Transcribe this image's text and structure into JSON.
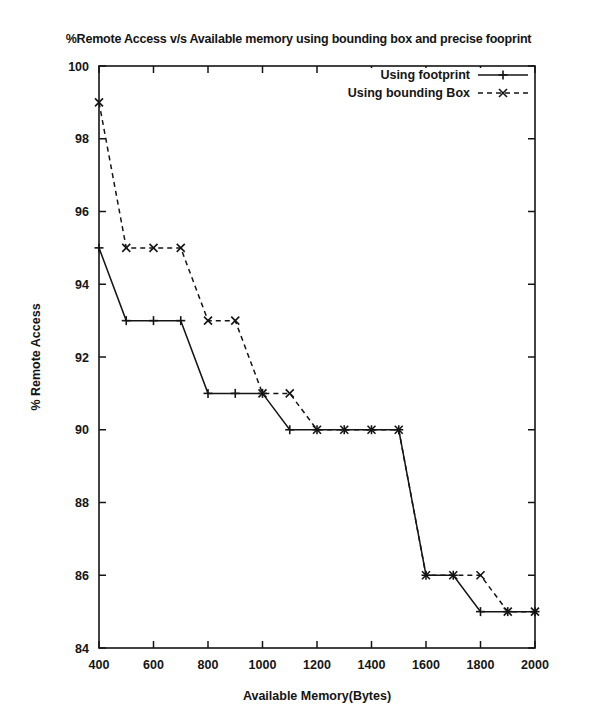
{
  "chart_data": {
    "type": "line",
    "title": "%Remote Access v/s Available memory using bounding box and precise fooprint",
    "xlabel": "Available Memory(Bytes)",
    "ylabel": "% Remote Access",
    "x": [
      400,
      500,
      600,
      700,
      800,
      900,
      1000,
      1100,
      1200,
      1300,
      1400,
      1500,
      1600,
      1700,
      1800,
      1900,
      2000
    ],
    "xlim": [
      400,
      2000
    ],
    "ylim": [
      84,
      100
    ],
    "xticks": [
      "400",
      "600",
      "800",
      "1000",
      "1200",
      "1400",
      "1600",
      "1800",
      "2000"
    ],
    "xtick_values": [
      400,
      600,
      800,
      1000,
      1200,
      1400,
      1600,
      1800,
      2000
    ],
    "yticks": [
      "84",
      "86",
      "88",
      "90",
      "92",
      "94",
      "96",
      "98",
      "100"
    ],
    "ytick_values": [
      84,
      86,
      88,
      90,
      92,
      94,
      96,
      98,
      100
    ],
    "grid": false,
    "legend_position": "top-right",
    "series": [
      {
        "name": "Using footprint",
        "style": "solid",
        "marker": "plus",
        "color": "#141414",
        "values": [
          95,
          93,
          93,
          93,
          91,
          91,
          91,
          90,
          90,
          90,
          90,
          90,
          86,
          86,
          85,
          85,
          85
        ]
      },
      {
        "name": "Using bounding Box",
        "style": "dashed",
        "marker": "cross",
        "color": "#141414",
        "values": [
          99,
          95,
          95,
          95,
          93,
          93,
          91,
          91,
          90,
          90,
          90,
          90,
          86,
          86,
          86,
          85,
          85
        ]
      }
    ]
  },
  "legend": {
    "entries": [
      {
        "label": "Using footprint"
      },
      {
        "label": "Using bounding Box"
      }
    ]
  }
}
